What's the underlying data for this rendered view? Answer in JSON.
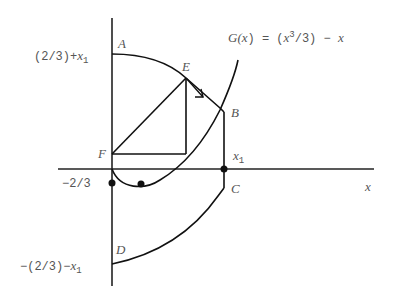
{
  "diagram": {
    "function_label": {
      "prefix": "G(",
      "var": "x",
      "mid": ") = (",
      "var2": "x",
      "sup": "3",
      "tail": "/3) − ",
      "var3": "x"
    },
    "axis_label_x": "x",
    "points": {
      "A": "A",
      "B": "B",
      "C": "C",
      "D": "D",
      "E": "E",
      "F": "F"
    },
    "y_labels": {
      "top_prefix": "(2/3)+",
      "top_var": "x",
      "top_sub": "1",
      "neg": "−2/3",
      "bottom_prefix": "−(2/3)−",
      "bottom_var": "x",
      "bottom_sub": "1"
    },
    "x1_label": {
      "var": "x",
      "sub": "1"
    }
  }
}
